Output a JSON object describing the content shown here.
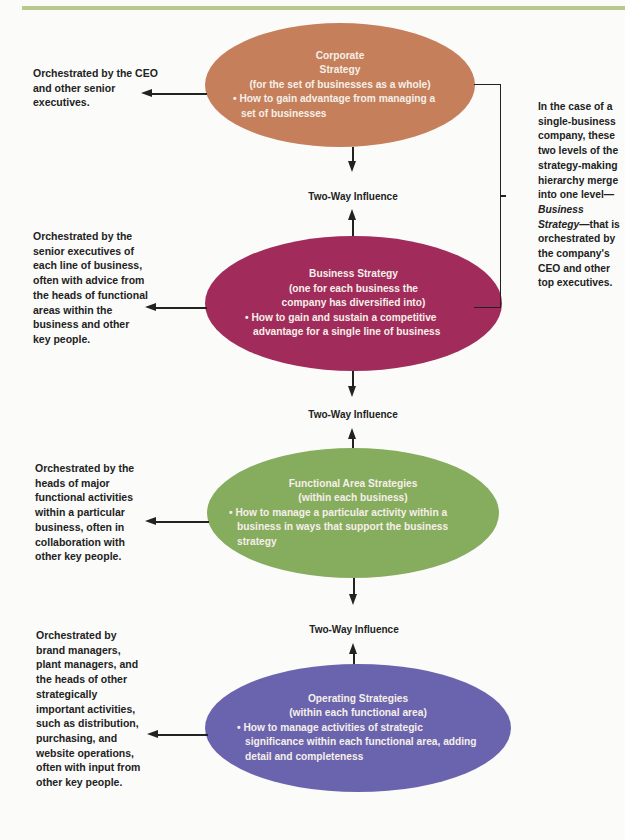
{
  "header": {
    "accent_color": "#b7c98f"
  },
  "levels": [
    {
      "id": "corporate",
      "color": "#c57f5a",
      "title_line1": "Corporate",
      "title_line2": "Strategy",
      "scope": "(for the set of businesses as a whole)",
      "bullet": "• How to gain advantage from managing a set of businesses",
      "orchestrated_by": "Orchestrated by the CEO and other senior executives."
    },
    {
      "id": "business",
      "color": "#a12b5a",
      "title": "Business Strategy",
      "scope": "(one for each business the company has diversified into)",
      "bullet": "• How to gain and sustain a competitive advantage for a single line of business",
      "orchestrated_by": "Orchestrated by the senior executives of each line of business, often with advice from the heads of functional areas within the business and other key people."
    },
    {
      "id": "functional",
      "color": "#86ac5e",
      "title": "Functional Area Strategies",
      "scope": "(within each business)",
      "bullet": "• How to manage a particular activity within a business in ways that support the business strategy",
      "orchestrated_by": "Orchestrated by the heads of major functional activities within a particular business, often in collaboration with other key people."
    },
    {
      "id": "operating",
      "color": "#6a64ae",
      "title": "Operating Strategies",
      "scope": "(within each functional area)",
      "bullet": "• How to manage activities of strategic significance within each functional area, adding detail and completeness",
      "orchestrated_by": "Orchestrated by brand managers, plant managers, and the heads of other strategically important activities, such as distribution, purchasing, and website operations, often with input from other key people."
    }
  ],
  "influence_label": "Two-Way Influence",
  "side_note": {
    "part1": "In the case of a single-business company, these two levels of the strategy-making hierarchy merge into one level—",
    "italic": "Business Strategy",
    "part2": "—that is orchestrated by the company's CEO and other top executives."
  }
}
